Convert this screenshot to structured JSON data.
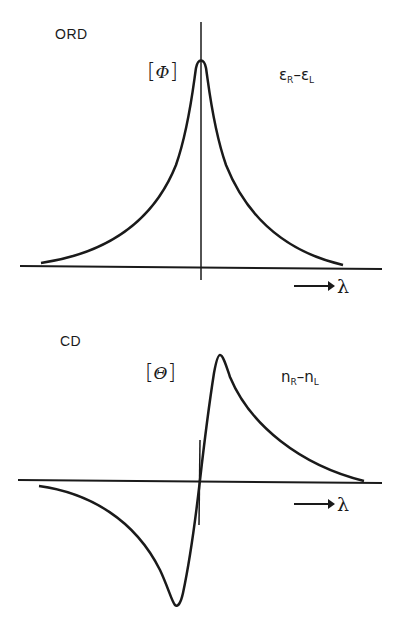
{
  "ord_panel": {
    "title": "ORD",
    "ylabel_open": "[",
    "ylabel_symbol": "Φ",
    "ylabel_close": "]",
    "annotation_main_a": "ε",
    "annotation_sub_a": "R",
    "annotation_dash": "–",
    "annotation_main_b": "ε",
    "annotation_sub_b": "L",
    "xlabel": "λ"
  },
  "cd_panel": {
    "title": "CD",
    "ylabel_open": "[",
    "ylabel_symbol": "Θ",
    "ylabel_close": "]",
    "annotation_main_a": "n",
    "annotation_sub_a": "R",
    "annotation_dash": "–",
    "annotation_main_b": "n",
    "annotation_sub_b": "L",
    "xlabel": "λ"
  },
  "colors": {
    "ink": "#1a1a1a",
    "background": "#ffffff"
  }
}
